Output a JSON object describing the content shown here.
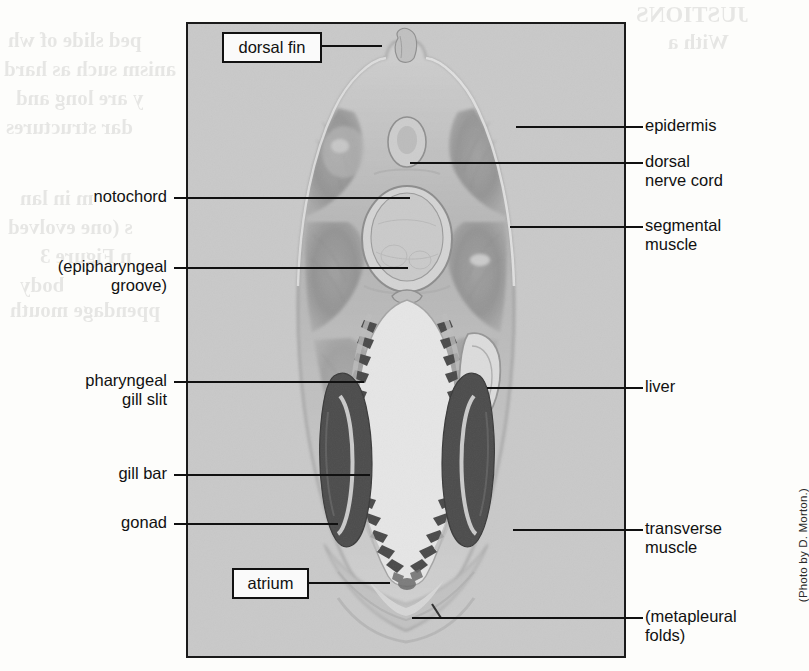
{
  "figure": {
    "panel": {
      "caption_credit": "(Photo by D. Morton.)",
      "background_color": "#c9c9c9",
      "border_color": "#1a1a1a"
    },
    "boxed_labels": [
      {
        "id": "dorsal-fin",
        "text": "dorsal fin"
      },
      {
        "id": "atrium",
        "text": "atrium"
      }
    ],
    "left_labels": [
      {
        "id": "notochord",
        "text": "notochord"
      },
      {
        "id": "epipharyngeal-groove",
        "text": "(epipharyngeal\ngroove)"
      },
      {
        "id": "pharyngeal-gill-slit",
        "text": "pharyngeal\ngill slit"
      },
      {
        "id": "gill-bar",
        "text": "gill bar"
      },
      {
        "id": "gonad",
        "text": "gonad"
      }
    ],
    "right_labels": [
      {
        "id": "epidermis",
        "text": "epidermis"
      },
      {
        "id": "dorsal-nerve-cord",
        "text": "dorsal\nnerve cord"
      },
      {
        "id": "segmental-muscle",
        "text": "segmental\nmuscle"
      },
      {
        "id": "liver",
        "text": "liver"
      },
      {
        "id": "transverse-muscle",
        "text": "transverse\nmuscle"
      },
      {
        "id": "metapleural-folds",
        "text": "(metapleural\nfolds)"
      }
    ],
    "showthrough": [
      {
        "id": "st1",
        "text": "ped slide of wh"
      },
      {
        "id": "st2",
        "text": "anism such as hard"
      },
      {
        "id": "st3",
        "text": "y are long and"
      },
      {
        "id": "st4",
        "text": "dar structures"
      },
      {
        "id": "st5",
        "text": "m in lan"
      },
      {
        "id": "st6",
        "text": "s (one evolved"
      },
      {
        "id": "st7",
        "text": "n Figure 3"
      },
      {
        "id": "st8",
        "text": "body"
      },
      {
        "id": "st9",
        "text": "ppendage mouth"
      },
      {
        "id": "st10",
        "text": "JUSTIONS"
      },
      {
        "id": "st11",
        "text": "With a"
      }
    ]
  }
}
